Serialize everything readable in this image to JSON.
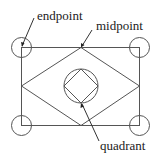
{
  "diagram": {
    "labels": {
      "endpoint": "endpoint",
      "midpoint": "midpoint",
      "quadrant": "quadrant"
    },
    "elements": {
      "rectangle": "rectangle",
      "diamond": "diamond connecting midpoints",
      "center_circle": "circle with inscribed square at quadrants",
      "corner_markers": 4
    },
    "colors": {
      "stroke": "#555555",
      "text": "#222222",
      "background": "#ffffff"
    }
  }
}
